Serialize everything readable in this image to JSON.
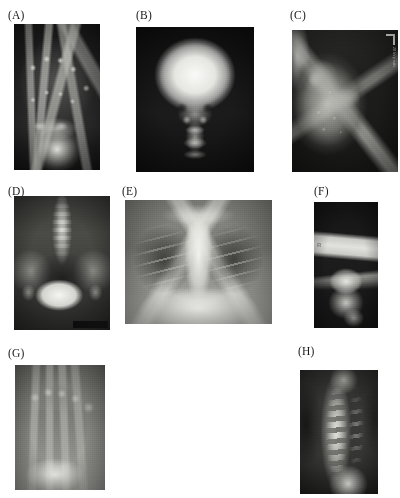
{
  "figure": {
    "background_color": "#ffffff",
    "width": 400,
    "height": 498,
    "panel_count": 8
  },
  "panels": [
    {
      "id": "a",
      "label": "(A)",
      "modality": "radiograph",
      "body_part": "hand-and-wrist",
      "view": "posteroanterior",
      "label_x": 8,
      "label_y": 10,
      "x": 14,
      "y": 24,
      "w": 86,
      "h": 146,
      "markers": []
    },
    {
      "id": "b",
      "label": "(B)",
      "modality": "radiograph",
      "body_part": "skull",
      "view": "anteroposterior",
      "label_x": 136,
      "label_y": 10,
      "x": 136,
      "y": 27,
      "w": 118,
      "h": 145,
      "markers": []
    },
    {
      "id": "c",
      "label": "(C)",
      "modality": "mammogram",
      "body_part": "breast",
      "view": "craniocaudal",
      "label_x": 290,
      "label_y": 10,
      "x": 292,
      "y": 30,
      "w": 106,
      "h": 142,
      "markers": [
        {
          "name": "laterality-marker",
          "text": "L"
        },
        {
          "name": "technique-annotation",
          "text": "28 kVp  mAs"
        }
      ]
    },
    {
      "id": "d",
      "label": "(D)",
      "modality": "radiograph",
      "body_part": "pelvis-bladder",
      "view": "cystogram",
      "label_x": 8,
      "label_y": 186,
      "x": 14,
      "y": 196,
      "w": 96,
      "h": 134,
      "markers": [
        {
          "name": "burned-in-annotation-strip",
          "text": ""
        }
      ]
    },
    {
      "id": "e",
      "label": "(E)",
      "modality": "radiograph",
      "body_part": "chest",
      "view": "posteroanterior",
      "label_x": 122,
      "label_y": 186,
      "x": 125,
      "y": 200,
      "w": 147,
      "h": 124,
      "markers": []
    },
    {
      "id": "f",
      "label": "(F)",
      "modality": "radiograph",
      "body_part": "ankle",
      "view": "anteroposterior",
      "label_x": 314,
      "label_y": 186,
      "x": 314,
      "y": 202,
      "w": 64,
      "h": 126,
      "markers": [
        {
          "name": "laterality-marker",
          "text": "R"
        }
      ]
    },
    {
      "id": "g",
      "label": "(G)",
      "modality": "radiograph",
      "body_part": "foot",
      "view": "dorsoplantar",
      "label_x": 8,
      "label_y": 348,
      "x": 15,
      "y": 365,
      "w": 90,
      "h": 125,
      "markers": []
    },
    {
      "id": "h",
      "label": "(H)",
      "modality": "radiograph",
      "body_part": "cervical-spine",
      "view": "lateral",
      "label_x": 298,
      "label_y": 346,
      "x": 300,
      "y": 370,
      "w": 78,
      "h": 124,
      "markers": []
    }
  ]
}
